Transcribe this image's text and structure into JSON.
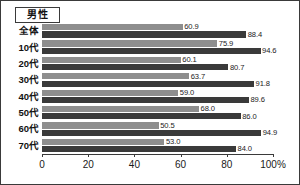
{
  "chart": {
    "title_badge": "男性",
    "axis_suffix": "%"
  },
  "chart_data": {
    "type": "bar",
    "orientation": "horizontal",
    "title": "男性",
    "xlabel": "",
    "ylabel": "",
    "xlim": [
      0,
      100
    ],
    "grid": false,
    "legend": "none",
    "categories": [
      "全体",
      "10代",
      "20代",
      "30代",
      "40代",
      "50代",
      "60代",
      "70代"
    ],
    "tick_labels": [
      "0",
      "20",
      "40",
      "60",
      "80",
      "100%"
    ],
    "tick_values": [
      0,
      20,
      40,
      60,
      80,
      100
    ],
    "series": [
      {
        "name": "series-1",
        "color": "#8e8e8e",
        "values": [
          60.9,
          75.9,
          60.1,
          63.7,
          59.0,
          68.0,
          50.5,
          53.0
        ],
        "labels": [
          "60.9",
          "75.9",
          "60.1",
          "63.7",
          "59.0",
          "68.0",
          "50.5",
          "53.0"
        ]
      },
      {
        "name": "series-2",
        "color": "#3a3a3a",
        "values": [
          88.4,
          94.6,
          80.7,
          91.8,
          89.6,
          86.0,
          94.9,
          84.0
        ],
        "labels": [
          "88.4",
          "94.6",
          "80.7",
          "91.8",
          "89.6",
          "86.0",
          "94.9",
          "84.0"
        ]
      }
    ]
  }
}
